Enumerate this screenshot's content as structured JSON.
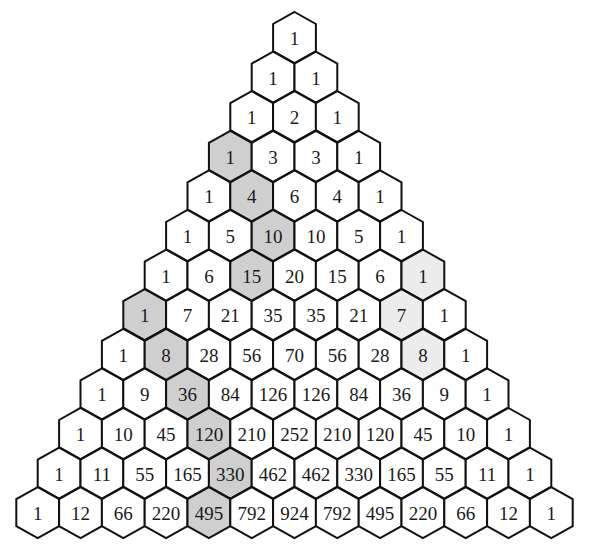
{
  "diagram": {
    "rows": [
      [
        1
      ],
      [
        1,
        1
      ],
      [
        1,
        2,
        1
      ],
      [
        1,
        3,
        3,
        1
      ],
      [
        1,
        4,
        6,
        4,
        1
      ],
      [
        1,
        5,
        10,
        10,
        5,
        1
      ],
      [
        1,
        6,
        15,
        20,
        15,
        6,
        1
      ],
      [
        1,
        7,
        21,
        35,
        35,
        21,
        7,
        1
      ],
      [
        1,
        8,
        28,
        56,
        70,
        56,
        28,
        8,
        1
      ],
      [
        1,
        9,
        36,
        84,
        126,
        126,
        84,
        36,
        9,
        1
      ],
      [
        1,
        10,
        45,
        120,
        210,
        252,
        210,
        120,
        45,
        10,
        1
      ],
      [
        1,
        11,
        55,
        165,
        330,
        462,
        462,
        330,
        165,
        55,
        11,
        1
      ],
      [
        1,
        12,
        66,
        220,
        495,
        792,
        924,
        792,
        495,
        220,
        66,
        12,
        1
      ]
    ],
    "highlights": [
      {
        "name": "hockey-stick-1",
        "color": "#cfcfcf",
        "cells": [
          [
            3,
            0
          ],
          [
            4,
            1
          ],
          [
            5,
            2
          ],
          [
            6,
            2
          ]
        ],
        "values": [
          1,
          4,
          10,
          15
        ]
      },
      {
        "name": "hockey-stick-2",
        "color": "#cfcfcf",
        "cells": [
          [
            7,
            0
          ],
          [
            8,
            1
          ],
          [
            9,
            2
          ],
          [
            10,
            3
          ],
          [
            11,
            4
          ],
          [
            12,
            4
          ]
        ],
        "values": [
          1,
          8,
          36,
          120,
          330,
          495
        ]
      },
      {
        "name": "hockey-stick-3",
        "color": "#ececec",
        "cells": [
          [
            6,
            6
          ],
          [
            7,
            6
          ],
          [
            8,
            7
          ]
        ],
        "values": [
          1,
          7,
          8
        ]
      }
    ],
    "colors": {
      "background": "#ffffff",
      "cell_fill": "#ffffff",
      "stroke": "#111111",
      "text": "#1a1a1a"
    }
  }
}
